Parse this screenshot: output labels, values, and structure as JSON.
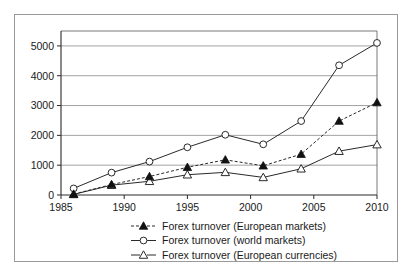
{
  "chart_data": {
    "type": "line",
    "title": "",
    "subtitle": "",
    "xlabel": "",
    "ylabel": "",
    "x": [
      1986,
      1989,
      1992,
      1995,
      1998,
      2001,
      2004,
      2007,
      2010
    ],
    "xticks": [
      "1985",
      "1990",
      "1995",
      "2000",
      "2005",
      "2010"
    ],
    "xtick_values": [
      1985,
      1990,
      1995,
      2000,
      2005,
      2010
    ],
    "yticks": [
      "0",
      "1000",
      "2000",
      "3000",
      "4000",
      "5000"
    ],
    "ytick_values": [
      0,
      1000,
      2000,
      3000,
      4000,
      5000
    ],
    "xlim": [
      1985,
      2010
    ],
    "ylim": [
      0,
      5500
    ],
    "grid": "horizontal",
    "legend_position": "bottom",
    "series": [
      {
        "name": "Forex turnover (European markets)",
        "marker": "filled-triangle",
        "line_style": "dashed",
        "color": "#111111",
        "values": [
          30,
          350,
          620,
          930,
          1180,
          980,
          1370,
          2480,
          3100
        ]
      },
      {
        "name": "Forex turnover (world markets)",
        "marker": "open-circle",
        "line_style": "solid",
        "color": "#2a2a2a",
        "values": [
          220,
          750,
          1120,
          1600,
          2020,
          1700,
          2480,
          4350,
          5100
        ]
      },
      {
        "name": "Forex turnover (European currencies)",
        "marker": "open-triangle",
        "line_style": "solid",
        "color": "#2a2a2a",
        "values": [
          20,
          330,
          460,
          680,
          760,
          590,
          880,
          1470,
          1690
        ]
      }
    ]
  },
  "legend": {
    "entries": [
      {
        "label": "Forex turnover (European markets)",
        "marker": "filled-triangle",
        "line": "dashed"
      },
      {
        "label": "Forex turnover (world markets)",
        "marker": "open-circle",
        "line": "solid"
      },
      {
        "label": "Forex turnover (European currencies)",
        "marker": "open-triangle",
        "line": "solid"
      }
    ]
  }
}
